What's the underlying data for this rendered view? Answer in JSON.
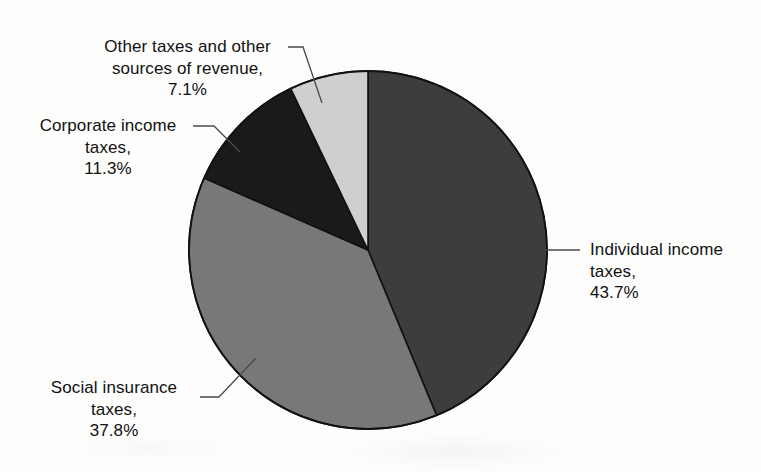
{
  "chart_data": {
    "type": "pie",
    "title": "",
    "subtitle": "",
    "xlabel": "",
    "ylabel": "",
    "legend_position": "none",
    "grid": false,
    "units": "percent",
    "total_label": "",
    "start_angle_deg": 0,
    "direction": "clockwise",
    "categories": [
      "Individual income taxes",
      "Social insurance taxes",
      "Corporate income taxes",
      "Other taxes and other sources of revenue"
    ],
    "values": [
      43.7,
      37.8,
      11.3,
      7.1
    ],
    "colors": [
      "#3d3d3d",
      "#787878",
      "#1a1a1a",
      "#cfcfcf"
    ],
    "slices": [
      {
        "name": "Individual income taxes",
        "value": 43.7,
        "value_label": "43.7%",
        "color": "#3d3d3d",
        "label_lines": [
          "Individual income",
          "taxes,",
          "43.7%"
        ],
        "leader": "straight-horizontal-right"
      },
      {
        "name": "Social insurance taxes",
        "value": 37.8,
        "value_label": "37.8%",
        "color": "#787878",
        "label_lines": [
          "Social insurance",
          "taxes,",
          "37.8%"
        ],
        "leader": "elbow-lower-left"
      },
      {
        "name": "Corporate income taxes",
        "value": 11.3,
        "value_label": "11.3%",
        "color": "#1a1a1a",
        "label_lines": [
          "Corporate income",
          "taxes,",
          "11.3%"
        ],
        "leader": "elbow-upper-left"
      },
      {
        "name": "Other taxes and other sources of revenue",
        "value": 7.1,
        "value_label": "7.1%",
        "color": "#cfcfcf",
        "label_lines": [
          "Other taxes and other",
          "sources of revenue,",
          "7.1%"
        ],
        "leader": "elbow-top"
      }
    ]
  },
  "labels": {
    "other": {
      "line1": "Other taxes and other",
      "line2": "sources of revenue,",
      "line3": "7.1%"
    },
    "corporate": {
      "line1": "Corporate income",
      "line2": "taxes,",
      "line3": "11.3%"
    },
    "social": {
      "line1": "Social insurance",
      "line2": "taxes,",
      "line3": "37.8%"
    },
    "individual": {
      "line1": "Individual income",
      "line2": "taxes,",
      "line3": "43.7%"
    }
  },
  "geometry": {
    "center_x": 368,
    "center_y": 250,
    "radius": 179
  },
  "style": {
    "outline_color": "#111111",
    "leader_color": "#4a4a4a",
    "background": "#fdfdfc",
    "text_color": "#111111"
  }
}
